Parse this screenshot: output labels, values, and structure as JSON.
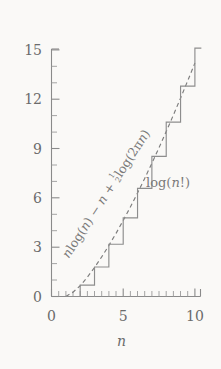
{
  "chart_data": {
    "type": "line",
    "title": "",
    "xlabel": "n",
    "ylabel": "",
    "xlim": [
      0,
      10.4
    ],
    "ylim": [
      0,
      15.6
    ],
    "grid": false,
    "legend": "inline-annotations",
    "x_ticks": [
      0,
      5,
      10
    ],
    "x_tick_labels": [
      "0",
      "5",
      "10"
    ],
    "x_minor_step": 0.5,
    "y_ticks": [
      0,
      3,
      6,
      9,
      12,
      15
    ],
    "y_tick_labels": [
      "0",
      "3",
      "6",
      "9",
      "12",
      "15"
    ],
    "y_minor_step": 1,
    "series": [
      {
        "name": "log(n!)",
        "style": "step",
        "color": "#8d8d8d",
        "x": [
          1,
          2,
          3,
          4,
          5,
          6,
          7,
          8,
          9,
          10
        ],
        "values": [
          0.0,
          0.693,
          1.792,
          3.178,
          4.787,
          6.579,
          8.525,
          10.604,
          12.801,
          15.104
        ]
      },
      {
        "name": "n log(n) - n + 1/2 log(2 pi n)",
        "style": "dashed",
        "color": "#7d7d7d",
        "x": [
          1.0,
          1.5,
          2.0,
          2.5,
          3.0,
          3.5,
          4.0,
          4.5,
          5.0,
          5.5,
          6.0,
          6.5,
          7.0,
          7.5,
          8.0,
          8.5,
          9.0,
          9.5,
          10.0
        ],
        "values": [
          -0.081,
          0.263,
          0.652,
          1.176,
          1.764,
          2.408,
          3.102,
          3.841,
          4.622,
          5.441,
          6.296,
          7.185,
          8.105,
          9.055,
          10.033,
          11.038,
          12.068,
          13.123,
          14.201
        ]
      }
    ],
    "annotations": [
      {
        "name": "stirling-label",
        "text": "n log(n) − n + ½ log(2πn)",
        "rotated": true,
        "rotation_deg": -57
      },
      {
        "name": "logfact-label",
        "text": "log(n!)",
        "rotated": false
      }
    ]
  },
  "labels": {
    "y": [
      "15",
      "12",
      "9",
      "6",
      "3",
      "0"
    ],
    "x": [
      "0",
      "5",
      "10"
    ],
    "x_axis_title": "n",
    "stirling": {
      "p1": "n",
      "p2": "log(",
      "p3": "n",
      "p4": ") − ",
      "p5": "n",
      "p6": " + ",
      "num": "1",
      "den": "2",
      "p7": "log(2π",
      "p8": "n",
      "p9": ")"
    },
    "logfact": {
      "p1": "log(",
      "p2": "n",
      "p3": "!)"
    }
  },
  "colors": {
    "background": "#faf9f7",
    "axis": "#8a8a8a",
    "step_series": "#8d8d8d",
    "dashed_series": "#7d7d7d",
    "text": "#6b6b6b"
  }
}
